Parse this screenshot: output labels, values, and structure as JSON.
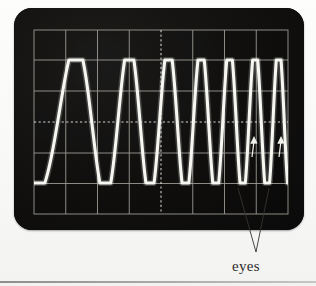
{
  "figure": {
    "kind": "oscilloscope-screenshot",
    "caption": "eyes",
    "annotation_count": 2,
    "background_color": "#fbfbf9",
    "screen_color": "#100f0f",
    "trace_color": "#f5f5f0",
    "grid_color": "#b9b9b2",
    "dashed_axis_color": "#efefe8"
  },
  "scope": {
    "bezel": {
      "x": 14,
      "y": 8,
      "width": 290,
      "height": 222,
      "corner_radius": 18
    },
    "graticule": {
      "x": 20,
      "y": 22,
      "width": 254,
      "height": 184,
      "columns": 8,
      "rows": 6,
      "grid_on": true,
      "center_axes_dashed": true,
      "center_x": 147,
      "center_y": 114
    },
    "trace": {
      "style": "solid",
      "line_width": 3.1,
      "top_rail_y": 52,
      "bottom_rail_y": 175,
      "description": "frequency-chirp / persistence overlay forming eye crossings"
    }
  },
  "chart_data": {
    "type": "line",
    "title": "",
    "subtitle": "",
    "xlabel": "",
    "ylabel": "",
    "xlim": [
      0,
      8
    ],
    "ylim": [
      -3,
      3
    ],
    "grid": true,
    "legend": null,
    "tick_labels_x": [],
    "tick_labels_y": [],
    "annotations": [
      {
        "text": "eyes",
        "kind": "leader-label",
        "target_count": 2
      },
      {
        "text": "",
        "kind": "arrow",
        "points_to": "eye-crossing-1"
      },
      {
        "text": "",
        "kind": "arrow",
        "points_to": "eye-crossing-2"
      }
    ],
    "series": [
      {
        "name": "chirped square-ish waveform",
        "waveform": "cosine chirp clipped to rails",
        "amplitude": 2.0,
        "baseline": 0,
        "cycles_visible": 9,
        "start_frequency_cycles_per_div": 0.28,
        "end_frequency_cycles_per_div": 1.45,
        "clip_high": 2.0,
        "clip_low": -2.0
      }
    ]
  },
  "annotations": {
    "arrows": [
      {
        "name": "eye-arrow-left",
        "tip_x": 240,
        "tip_y": 130,
        "tail_x": 238,
        "tail_y": 149
      },
      {
        "name": "eye-arrow-right",
        "tip_x": 267,
        "tip_y": 130,
        "tail_x": 265,
        "tail_y": 149
      }
    ],
    "leader_lines": [
      {
        "from_x": 256,
        "from_y": 253,
        "to_x": 238,
        "to_y": 190
      },
      {
        "from_x": 256,
        "from_y": 253,
        "to_x": 268,
        "to_y": 190
      }
    ]
  }
}
